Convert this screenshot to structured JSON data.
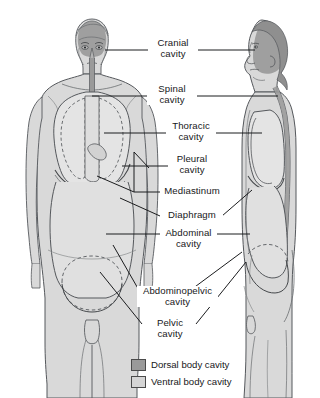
{
  "diagram": {
    "views": [
      {
        "name": "anterior-view",
        "description": "Anterior (frontal) view of human body showing body cavities"
      },
      {
        "name": "lateral-view",
        "description": "Lateral (sagittal profile) view of human body showing body cavities"
      }
    ]
  },
  "labels": [
    {
      "id": "cranial",
      "line1": "Cranial",
      "line2": "cavity"
    },
    {
      "id": "spinal",
      "line1": "Spinal",
      "line2": "cavity"
    },
    {
      "id": "thoracic",
      "line1": "Thoracic",
      "line2": "cavity"
    },
    {
      "id": "pleural",
      "line1": "Pleural",
      "line2": "cavity"
    },
    {
      "id": "mediastinum",
      "line1": "Mediastinum",
      "line2": ""
    },
    {
      "id": "diaphragm",
      "line1": "Diaphragm",
      "line2": ""
    },
    {
      "id": "abdominal",
      "line1": "Abdominal",
      "line2": "cavity"
    },
    {
      "id": "abdominopelvic",
      "line1": "Abdominopelvic",
      "line2": "cavity"
    },
    {
      "id": "pelvic",
      "line1": "Pelvic",
      "line2": "cavity"
    }
  ],
  "legend": {
    "items": [
      {
        "label": "Dorsal body cavity",
        "color": "#9a9a9a"
      },
      {
        "label": "Ventral body cavity",
        "color": "#d5d5d5"
      }
    ]
  },
  "colors": {
    "background": "#ffffff",
    "body_fill": "#d9d9d9",
    "body_fill_light": "#e4e4e4",
    "dorsal_cavity": "#9a9a9a",
    "ventral_cavity": "#d5d5d5",
    "outline": "#55585c",
    "leader_line": "#1b1c1e",
    "text": "#17181a"
  }
}
